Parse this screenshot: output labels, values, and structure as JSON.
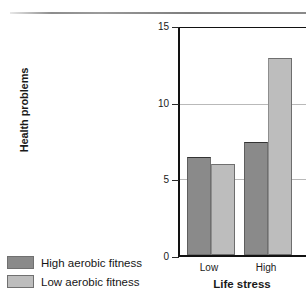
{
  "chart_data": {
    "type": "bar",
    "title": "",
    "subtitle": "",
    "xlabel": "Life stress",
    "ylabel": "Health problems",
    "categories": [
      "Low",
      "High"
    ],
    "series": [
      {
        "name": "High aerobic fitness",
        "color": "#8a8a8a",
        "values": [
          6.5,
          7.5
        ]
      },
      {
        "name": "Low aerobic fitness",
        "color": "#bdbdbd",
        "values": [
          6.0,
          13.0
        ]
      }
    ],
    "ylim": [
      0,
      15
    ],
    "yticks": [
      0,
      5,
      10,
      15
    ],
    "ytick_labels": [
      "0",
      "5",
      "10",
      "15"
    ],
    "xtick_labels": [
      "Low",
      "High"
    ],
    "grid": "horizontal gridlines at 5 and 10",
    "legend_position": "outside bottom-left"
  },
  "axes": {
    "y_title": "Health problems",
    "x_title": "Life stress",
    "y_ticks": [
      {
        "label": "15",
        "value": 15
      },
      {
        "label": "10",
        "value": 10
      },
      {
        "label": "5",
        "value": 5
      },
      {
        "label": "0",
        "value": 0
      }
    ],
    "x_ticks": [
      {
        "label": "Low"
      },
      {
        "label": "High"
      }
    ]
  },
  "legend": {
    "items": [
      {
        "label": "High aerobic fitness",
        "color": "#8a8a8a"
      },
      {
        "label": "Low aerobic fitness",
        "color": "#bdbdbd"
      }
    ]
  },
  "colors": {
    "high_fitness": "#8a8a8a",
    "low_fitness": "#bdbdbd",
    "axis": "#121212",
    "gridline": "#b9b9b9"
  }
}
